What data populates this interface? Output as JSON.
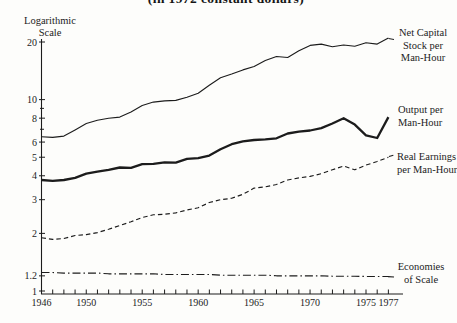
{
  "page": {
    "title_partial": "(in 1972 constant dollars)",
    "y_axis_title": [
      "Logarithmic",
      "Scale"
    ]
  },
  "chart_data": {
    "type": "line",
    "title": "(in 1972 constant dollars)",
    "y_scale": "logarithmic",
    "y_range": [
      1,
      20
    ],
    "grid": "off",
    "line_color": "#1c1c1c",
    "y_ticks": [
      {
        "value": 20,
        "label": "20"
      },
      {
        "value": 10,
        "label": "10"
      },
      {
        "value": 9,
        "label": ""
      },
      {
        "value": 8,
        "label": "8"
      },
      {
        "value": 7,
        "label": ""
      },
      {
        "value": 6,
        "label": "6"
      },
      {
        "value": 5,
        "label": "5"
      },
      {
        "value": 4,
        "label": "4"
      },
      {
        "value": 3,
        "label": "3"
      },
      {
        "value": 2,
        "label": "2"
      },
      {
        "value": 1.2,
        "label": "1.2"
      },
      {
        "value": 1,
        "label": "1"
      }
    ],
    "x_labeled_years": [
      "1946",
      "1950",
      "1955",
      "1960",
      "1965",
      "1970",
      "1975",
      "1977"
    ],
    "years": [
      1946,
      1947,
      1948,
      1949,
      1950,
      1951,
      1952,
      1953,
      1954,
      1955,
      1956,
      1957,
      1958,
      1959,
      1960,
      1961,
      1962,
      1963,
      1964,
      1965,
      1966,
      1967,
      1968,
      1969,
      1970,
      1971,
      1972,
      1973,
      1974,
      1975,
      1976,
      1977
    ],
    "series": [
      {
        "id": "net_capital",
        "label": "Net Capital Stock per Man-Hour",
        "label_lines": [
          "Net Capital",
          "Stock per",
          "Man-Hour"
        ],
        "style": "solid-thin",
        "values": [
          6.4,
          6.35,
          6.45,
          6.95,
          7.5,
          7.8,
          8.0,
          8.1,
          8.6,
          9.3,
          9.7,
          9.85,
          9.9,
          10.3,
          10.8,
          11.9,
          13.0,
          13.6,
          14.3,
          14.9,
          16.0,
          16.8,
          16.6,
          18.0,
          19.2,
          19.5,
          18.9,
          19.3,
          19.0,
          19.8,
          19.5,
          21.0
        ]
      },
      {
        "id": "output",
        "label": "Output per Man-Hour",
        "label_lines": [
          "Output per",
          "Man-Hour"
        ],
        "style": "solid-thick",
        "values": [
          3.8,
          3.76,
          3.8,
          3.9,
          4.1,
          4.2,
          4.3,
          4.42,
          4.4,
          4.6,
          4.62,
          4.7,
          4.68,
          4.9,
          4.95,
          5.1,
          5.5,
          5.85,
          6.05,
          6.15,
          6.2,
          6.28,
          6.65,
          6.8,
          6.9,
          7.1,
          7.5,
          8.0,
          7.4,
          6.5,
          6.3,
          8.1
        ]
      },
      {
        "id": "real_earnings",
        "label": "Real Earnings per Man-Hour",
        "label_lines": [
          "Real Earnings",
          "per Man-Hour"
        ],
        "style": "dashed",
        "values": [
          1.9,
          1.86,
          1.88,
          1.95,
          1.97,
          2.02,
          2.1,
          2.2,
          2.3,
          2.42,
          2.5,
          2.52,
          2.56,
          2.65,
          2.72,
          2.9,
          3.0,
          3.05,
          3.2,
          3.45,
          3.5,
          3.6,
          3.8,
          3.9,
          3.97,
          4.1,
          4.3,
          4.5,
          4.3,
          4.55,
          4.75,
          5.0
        ]
      },
      {
        "id": "economies",
        "label": "Economies of Scale",
        "label_lines": [
          "Economies",
          "of Scale"
        ],
        "style": "dash-dot",
        "values": [
          1.25,
          1.25,
          1.24,
          1.24,
          1.24,
          1.24,
          1.23,
          1.23,
          1.23,
          1.23,
          1.23,
          1.22,
          1.22,
          1.22,
          1.22,
          1.22,
          1.21,
          1.21,
          1.21,
          1.21,
          1.21,
          1.2,
          1.2,
          1.2,
          1.2,
          1.2,
          1.195,
          1.195,
          1.195,
          1.19,
          1.19,
          1.19
        ]
      }
    ]
  }
}
